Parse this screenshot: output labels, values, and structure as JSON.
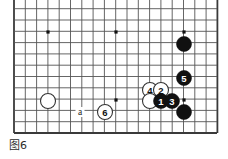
{
  "figure": {
    "caption": "图6",
    "caption_label": "figure-6"
  },
  "board": {
    "type": "go-board-diagram",
    "background_color": "#ffffff",
    "line_color": "#555555",
    "border_color": "#3a3a3a",
    "black_color": "#111111",
    "white_color": "#ffffff",
    "grid_spacing": 11.3,
    "left": 14,
    "right": 217,
    "top": 14,
    "bottom": 133,
    "cols": 19,
    "rows": 12,
    "star_points": [
      {
        "x": 48,
        "y": 32
      },
      {
        "x": 116,
        "y": 32
      },
      {
        "x": 184,
        "y": 32
      },
      {
        "x": 116,
        "y": 100
      },
      {
        "x": 184,
        "y": 100
      }
    ]
  },
  "stones": [
    {
      "id": "black-corner-upper",
      "color": "black",
      "label": "",
      "x": 184,
      "y": 44,
      "r": 7.5
    },
    {
      "id": "black-move-5",
      "color": "black",
      "label": "5",
      "x": 184,
      "y": 78,
      "r": 7.5
    },
    {
      "id": "white-move-4",
      "color": "white",
      "label": "4",
      "x": 150,
      "y": 90,
      "r": 7.5
    },
    {
      "id": "white-move-2",
      "color": "white",
      "label": "2",
      "x": 161,
      "y": 90,
      "r": 7.5
    },
    {
      "id": "white-plain-right",
      "color": "white",
      "label": "",
      "x": 150,
      "y": 101,
      "r": 7.5
    },
    {
      "id": "black-move-1",
      "color": "black",
      "label": "1",
      "x": 161,
      "y": 101,
      "r": 7.5
    },
    {
      "id": "black-move-3",
      "color": "black",
      "label": "3",
      "x": 172,
      "y": 101,
      "r": 7.5
    },
    {
      "id": "black-plain-lower-right",
      "color": "black",
      "label": "",
      "x": 184,
      "y": 112,
      "r": 7.5
    },
    {
      "id": "white-plain-left",
      "color": "white",
      "label": "",
      "x": 48,
      "y": 101,
      "r": 7.5
    },
    {
      "id": "white-move-6",
      "color": "white",
      "label": "6",
      "x": 105,
      "y": 112,
      "r": 7.5
    }
  ],
  "markers": [
    {
      "id": "point-a",
      "label": "a",
      "x": 80,
      "y": 112
    }
  ]
}
